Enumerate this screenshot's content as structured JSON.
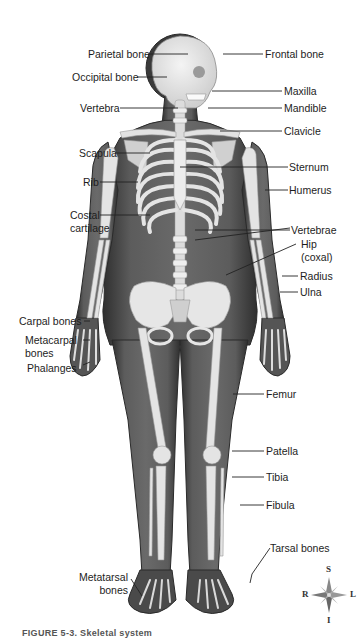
{
  "figure": {
    "caption": "FIGURE 5-3. Skeletal system",
    "colors": {
      "skin": "#5a5a5a",
      "skin_dark": "#3c3c3c",
      "bone": "#e6e6e6",
      "bone_shade": "#c8c8c8",
      "line": "#222222",
      "background": "#ffffff"
    }
  },
  "labels": {
    "left": [
      {
        "id": "parietal",
        "text": "Parietal bone"
      },
      {
        "id": "occipital",
        "text": "Occipital bone"
      },
      {
        "id": "vertebra",
        "text": "Vertebra"
      },
      {
        "id": "scapula",
        "text": "Scapula"
      },
      {
        "id": "rib",
        "text": "Rib"
      },
      {
        "id": "costal1",
        "text": "Costal"
      },
      {
        "id": "costal2",
        "text": "cartilage"
      },
      {
        "id": "carpal",
        "text": "Carpal bones"
      },
      {
        "id": "metacarpal1",
        "text": "Metacarpal"
      },
      {
        "id": "metacarpal2",
        "text": "bones"
      },
      {
        "id": "phalanges",
        "text": "Phalanges"
      },
      {
        "id": "metatarsal1",
        "text": "Metatarsal"
      },
      {
        "id": "metatarsal2",
        "text": "bones"
      }
    ],
    "right": [
      {
        "id": "frontal",
        "text": "Frontal bone"
      },
      {
        "id": "maxilla",
        "text": "Maxilla"
      },
      {
        "id": "mandible",
        "text": "Mandible"
      },
      {
        "id": "clavicle",
        "text": "Clavicle"
      },
      {
        "id": "sternum",
        "text": "Sternum"
      },
      {
        "id": "humerus",
        "text": "Humerus"
      },
      {
        "id": "vertebrae",
        "text": "Vertebrae"
      },
      {
        "id": "hip1",
        "text": "Hip"
      },
      {
        "id": "hip2",
        "text": "(coxal)"
      },
      {
        "id": "radius",
        "text": "Radius"
      },
      {
        "id": "ulna",
        "text": "Ulna"
      },
      {
        "id": "femur",
        "text": "Femur"
      },
      {
        "id": "patella",
        "text": "Patella"
      },
      {
        "id": "tibia",
        "text": "Tibia"
      },
      {
        "id": "fibula",
        "text": "Fibula"
      },
      {
        "id": "tarsal",
        "text": "Tarsal bones"
      }
    ]
  },
  "compass": {
    "superior": "S",
    "inferior": "I",
    "right": "R",
    "left": "L",
    "icon": "compass-rose-icon"
  }
}
